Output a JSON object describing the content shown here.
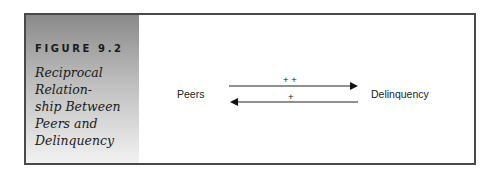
{
  "figure": {
    "label": "FIGURE 9.2",
    "title_lines": [
      "Reciprocal",
      "Relation-",
      "ship Between",
      "Peers and",
      "Delinquency"
    ]
  },
  "diagram": {
    "nodes": [
      {
        "id": "peers",
        "label": "Peers"
      },
      {
        "id": "delinquency",
        "label": "Delinquency"
      }
    ],
    "edges": [
      {
        "from": "peers",
        "to": "delinquency",
        "label": "+ +"
      },
      {
        "from": "delinquency",
        "to": "peers",
        "label": "+"
      }
    ]
  }
}
